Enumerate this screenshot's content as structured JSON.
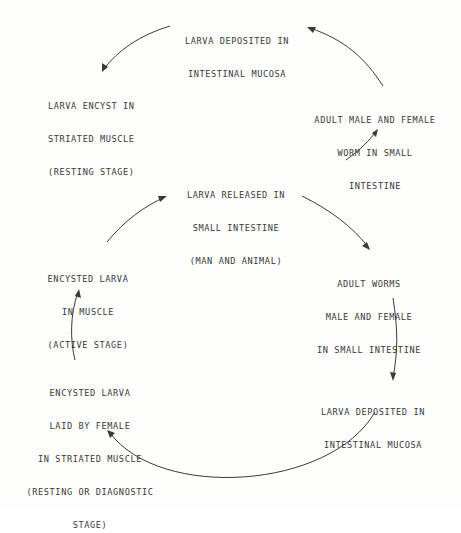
{
  "diagram": {
    "title": "",
    "upper_cycle": {
      "nodes": [
        {
          "id": "upper-larva-deposited",
          "lines": [
            "LARVA DEPOSITED IN",
            "INTESTINAL MUCOSA"
          ]
        },
        {
          "id": "larva-encyst",
          "lines": [
            "LARVA ENCYST IN",
            "STRIATED MUSCLE",
            "(RESTING STAGE)"
          ]
        },
        {
          "id": "adult-male-female-worm",
          "lines": [
            "ADULT MALE AND FEMALE",
            "WORM IN SMALL",
            "INTESTINE"
          ]
        }
      ]
    },
    "shared_node": {
      "id": "larva-released",
      "lines": [
        "LARVA RELEASED IN",
        "SMALL INTESTINE",
        "(MAN AND ANIMAL)"
      ]
    },
    "lower_cycle": {
      "nodes": [
        {
          "id": "adult-worms",
          "lines": [
            "ADULT WORMS",
            "MALE AND FEMALE",
            "IN SMALL INTESTINE"
          ]
        },
        {
          "id": "lower-larva-deposited",
          "lines": [
            "LARVA DEPOSITED IN",
            "INTESTINAL MUCOSA"
          ]
        },
        {
          "id": "encysted-larva-laid",
          "lines": [
            "ENCYSTED LARVA",
            "LAID BY FEMALE",
            "IN STRIATED MUSCLE",
            "(RESTING OR DIAGNOSTIC",
            "STAGE)"
          ]
        },
        {
          "id": "encysted-larva-active",
          "lines": [
            "ENCYSTED LARVA",
            "IN MUSCLE",
            "(ACTIVE STAGE)"
          ]
        }
      ]
    },
    "edges": [
      {
        "from": "larva-released",
        "to": "adult-male-female-worm"
      },
      {
        "from": "adult-male-female-worm",
        "to": "upper-larva-deposited"
      },
      {
        "from": "upper-larva-deposited",
        "to": "larva-encyst"
      },
      {
        "from": "larva-released",
        "to": "adult-worms"
      },
      {
        "from": "adult-worms",
        "to": "lower-larva-deposited"
      },
      {
        "from": "lower-larva-deposited",
        "to": "encysted-larva-laid"
      },
      {
        "from": "encysted-larva-laid",
        "to": "encysted-larva-active"
      },
      {
        "from": "encysted-larva-active",
        "to": "larva-released"
      }
    ]
  }
}
